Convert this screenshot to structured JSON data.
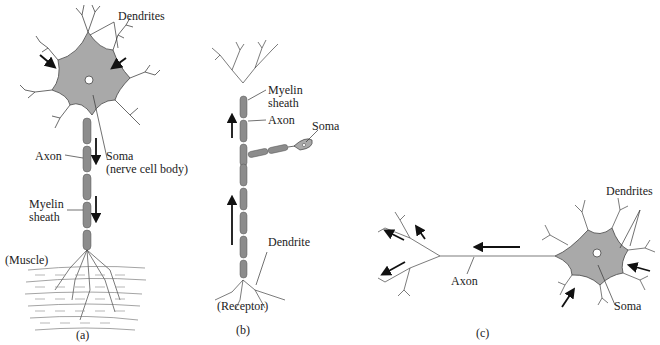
{
  "figure": {
    "panel_a": {
      "caption": "(a)",
      "labels": {
        "dendrites": "Dendrites",
        "axon": "Axon",
        "soma_line1": "Soma",
        "soma_line2": "(nerve cell body)",
        "myelin_line1": "Myelin",
        "myelin_line2": "sheath",
        "muscle": "(Muscle)"
      }
    },
    "panel_b": {
      "caption": "(b)",
      "labels": {
        "myelin_line1": "Myelin",
        "myelin_line2": "sheath",
        "axon": "Axon",
        "soma": "Soma",
        "dendrite": "Dendrite",
        "receptor": "(Receptor)"
      }
    },
    "panel_c": {
      "caption": "(c)",
      "labels": {
        "dendrites": "Dendrites",
        "axon": "Axon",
        "soma": "Soma"
      }
    },
    "colors": {
      "soma_fill": "#a9a9a9",
      "myelin_fill": "#8c8c8c",
      "line": "#333333",
      "arrow": "#111111"
    }
  }
}
